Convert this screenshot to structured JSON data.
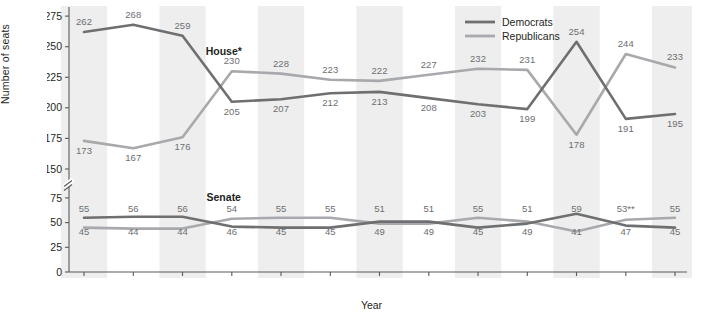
{
  "axes": {
    "ylabel": "Number of seats",
    "xlabel": "Year",
    "yticks_upper": [
      "275",
      "250",
      "225",
      "200",
      "175",
      "150"
    ],
    "yticks_lower": [
      "75",
      "50",
      "25",
      "0"
    ],
    "axis_break": "break-marker"
  },
  "legend": {
    "position": "top-right",
    "items": [
      {
        "label": "Democrats",
        "color": "#6e6f71"
      },
      {
        "label": "Republicans",
        "color": "#a7a9ac"
      }
    ]
  },
  "annotations": {
    "house": "House*",
    "senate": "Senate"
  },
  "colors": {
    "democrats": "#6e6f71",
    "republicans": "#a7a9ac",
    "band": "#eeeeee",
    "axis": "#58595b",
    "datalabel": "#6d6e71"
  },
  "chart_data": {
    "type": "line",
    "title": "",
    "xlabel": "Year",
    "ylabel": "Number of seats",
    "grid": false,
    "legend_position": "top-right",
    "axis_break": {
      "between": [
        75,
        150
      ]
    },
    "ylim_upper": [
      150,
      280
    ],
    "ylim_lower": [
      0,
      80
    ],
    "categories": [
      "1989–1990",
      "1991–1992",
      "1993–1994",
      "1995–1996",
      "1997–1998",
      "1999–2000",
      "2001–2002",
      "2003–2004",
      "2005–2006",
      "2007–2008",
      "2009–2010",
      "2011–2013",
      "2013–2015"
    ],
    "panels": [
      {
        "name": "House*",
        "series": [
          {
            "name": "Democrats",
            "values": [
              262,
              268,
              259,
              205,
              207,
              212,
              213,
              208,
              203,
              199,
              254,
              191,
              195
            ]
          },
          {
            "name": "Republicans",
            "values": [
              173,
              167,
              176,
              230,
              228,
              223,
              222,
              227,
              232,
              231,
              178,
              244,
              233
            ]
          }
        ]
      },
      {
        "name": "Senate",
        "series": [
          {
            "name": "Democrats",
            "values": [
              55,
              56,
              56,
              46,
              45,
              45,
              51,
              51,
              45,
              49,
              59,
              47,
              45
            ]
          },
          {
            "name": "Republicans",
            "values": [
              45,
              44,
              44,
              54,
              55,
              55,
              49,
              49,
              55,
              51,
              41,
              53,
              55
            ]
          }
        ],
        "labels_top": [
          "55",
          "56",
          "56",
          "54",
          "55",
          "55",
          "51",
          "51",
          "55",
          "51",
          "59",
          "53**",
          "55"
        ],
        "labels_bottom": [
          "45",
          "44",
          "44",
          "46",
          "45",
          "45",
          "49",
          "49",
          "45",
          "49",
          "41",
          "47",
          "45"
        ]
      }
    ]
  }
}
